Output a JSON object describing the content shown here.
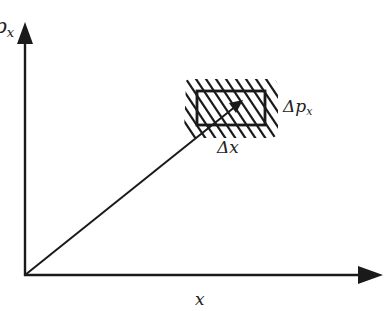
{
  "diagram": {
    "title": "",
    "axes": {
      "x_label": "x",
      "y_label_main": "p",
      "y_label_sub": "x"
    },
    "annotations": {
      "delta_x_symbol": "Δ",
      "delta_x_var": "x",
      "delta_p_symbol": "Δ",
      "delta_p_var": "p",
      "delta_p_sub": "x"
    },
    "colors": {
      "stroke": "#1a1a1a",
      "background": "#ffffff"
    },
    "elements": [
      {
        "type": "axis",
        "name": "x-axis",
        "from": [
          25,
          275
        ],
        "to": [
          383,
          275
        ]
      },
      {
        "type": "axis",
        "name": "p-axis",
        "from": [
          25,
          275
        ],
        "to": [
          25,
          22
        ]
      },
      {
        "type": "vector",
        "name": "phase-point-vector",
        "from": [
          25,
          275
        ],
        "to": [
          243,
          100
        ]
      },
      {
        "type": "rect",
        "name": "uncertainty-cell",
        "x": 197,
        "y": 91,
        "w": 68,
        "h": 34
      },
      {
        "type": "hatch-region",
        "name": "uncertainty-hatch",
        "x": 183,
        "y": 79,
        "w": 95,
        "h": 59
      }
    ]
  }
}
